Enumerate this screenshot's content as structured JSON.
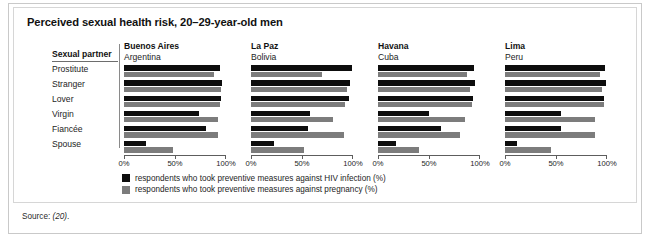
{
  "figure": {
    "title": "Perceived sexual health risk, 20–29-year-old men",
    "row_header": "Sexual partner",
    "source_prefix": "Source: ",
    "source_ref": "(20)",
    "source_suffix": "."
  },
  "legend": {
    "position": "bottom-center",
    "items": [
      {
        "key": "hiv",
        "color": "#0d0d0d",
        "label": "respondents who took preventive measures against HIV infection (%)"
      },
      {
        "key": "preg",
        "color": "#7c7c7c",
        "label": "respondents who took preventive measures against pregnancy (%)"
      }
    ]
  },
  "axis": {
    "ticks": [
      "0%",
      "50%",
      "100%"
    ],
    "tick_values": [
      0,
      50,
      100
    ],
    "min": 0,
    "max": 100
  },
  "chart_data": {
    "type": "bar",
    "orientation": "horizontal",
    "title": "Perceived sexual health risk, 20–29-year-old men",
    "xlabel": "",
    "ylabel": "Sexual partner",
    "xlim": [
      0,
      100
    ],
    "grid": false,
    "legend_position": "bottom-center",
    "categories": [
      "Prostitute",
      "Stranger",
      "Lover",
      "Virgin",
      "Fiancée",
      "Spouse"
    ],
    "panels": [
      {
        "city": "Buenos Aires",
        "country": "Argentina",
        "series": [
          {
            "name": "respondents who took preventive measures against HIV infection (%)",
            "key": "hiv",
            "color": "#0d0d0d",
            "values": [
              94,
              96,
              95,
              74,
              80,
              22
            ]
          },
          {
            "name": "respondents who took preventive measures against pregnancy (%)",
            "key": "preg",
            "color": "#7c7c7c",
            "values": [
              88,
              95,
              94,
              92,
              92,
              48
            ]
          }
        ]
      },
      {
        "city": "La Paz",
        "country": "Bolivia",
        "series": [
          {
            "name": "respondents who took preventive measures against HIV infection (%)",
            "key": "hiv",
            "color": "#0d0d0d",
            "values": [
              99,
              97,
              96,
              58,
              56,
              23
            ]
          },
          {
            "name": "respondents who took preventive measures against pregnancy (%)",
            "key": "preg",
            "color": "#7c7c7c",
            "values": [
              70,
              94,
              92,
              80,
              91,
              52
            ]
          }
        ]
      },
      {
        "city": "Havana",
        "country": "Cuba",
        "series": [
          {
            "name": "respondents who took preventive measures against HIV infection (%)",
            "key": "hiv",
            "color": "#0d0d0d",
            "values": [
              94,
              95,
              93,
              50,
              62,
              18
            ]
          },
          {
            "name": "respondents who took preventive measures against pregnancy (%)",
            "key": "preg",
            "color": "#7c7c7c",
            "values": [
              87,
              90,
              92,
              85,
              80,
              40
            ]
          }
        ]
      },
      {
        "city": "Lima",
        "country": "Peru",
        "series": [
          {
            "name": "respondents who took preventive measures against HIV infection (%)",
            "key": "hiv",
            "color": "#0d0d0d",
            "values": [
              98,
              99,
              97,
              55,
              55,
              12
            ]
          },
          {
            "name": "respondents who took preventive measures against pregnancy (%)",
            "key": "preg",
            "color": "#7c7c7c",
            "values": [
              93,
              95,
              97,
              88,
              88,
              45
            ]
          }
        ]
      }
    ]
  }
}
